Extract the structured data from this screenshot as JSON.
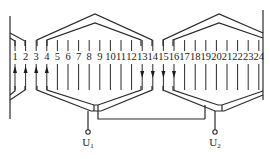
{
  "diagram": {
    "title": "",
    "slots": [
      "1",
      "2",
      "3",
      "4",
      "5",
      "6",
      "7",
      "8",
      "9",
      "10",
      "11",
      "12",
      "13",
      "14",
      "15",
      "16",
      "17",
      "18",
      "19",
      "20",
      "21",
      "22",
      "23",
      "24"
    ],
    "arrows": {
      "up": [
        "1",
        "2",
        "3",
        "4"
      ],
      "down": [
        "13",
        "14",
        "15",
        "16"
      ]
    },
    "coil_groups": [
      {
        "name": "left-group",
        "outer_from_slot": "3",
        "outer_to_slot": "14",
        "inner_from_slot": "4",
        "inner_to_slot": "13"
      },
      {
        "name": "right-group",
        "outer_from_slot": "15",
        "outer_to_slot": "24",
        "inner_from_slot": "16",
        "inner_to_slot": "24"
      }
    ],
    "terminals": [
      {
        "id": "U1",
        "base": "U",
        "sub": "1"
      },
      {
        "id": "U2",
        "base": "U",
        "sub": "2"
      }
    ],
    "colors": {
      "line": "#2a2a2a",
      "text": "#1a1a1a",
      "background": "#ffffff"
    }
  }
}
